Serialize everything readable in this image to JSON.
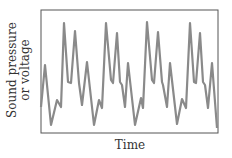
{
  "chart_data": {
    "type": "line",
    "title": "",
    "xlabel": "Time",
    "ylabel_lines": [
      "Sound pressure",
      "or voltage"
    ],
    "ylabel": "Sound pressure or voltage",
    "grid": false,
    "legend": null,
    "ticks": {
      "x": [],
      "y": []
    },
    "colors": {
      "line": "#8a8a8a",
      "frame": "#555555"
    },
    "points_px": [
      [
        41,
        107
      ],
      [
        45,
        65
      ],
      [
        51,
        125
      ],
      [
        57,
        100
      ],
      [
        61,
        107
      ],
      [
        64,
        23
      ],
      [
        68,
        82
      ],
      [
        71,
        83
      ],
      [
        75,
        31
      ],
      [
        79,
        83
      ],
      [
        82,
        105
      ],
      [
        87,
        62
      ],
      [
        94,
        125
      ],
      [
        99,
        100
      ],
      [
        102,
        108
      ],
      [
        106,
        23
      ],
      [
        111,
        80
      ],
      [
        113,
        83
      ],
      [
        117,
        33
      ],
      [
        120,
        82
      ],
      [
        122,
        85
      ],
      [
        125,
        107
      ],
      [
        128,
        63
      ],
      [
        135,
        125
      ],
      [
        141,
        98
      ],
      [
        143,
        108
      ],
      [
        147,
        22
      ],
      [
        152,
        80
      ],
      [
        154,
        83
      ],
      [
        158,
        32
      ],
      [
        162,
        82
      ],
      [
        163,
        85
      ],
      [
        167,
        107
      ],
      [
        170,
        63
      ],
      [
        177,
        124
      ],
      [
        182,
        99
      ],
      [
        186,
        108
      ],
      [
        190,
        23
      ],
      [
        194,
        82
      ],
      [
        196,
        83
      ],
      [
        200,
        33
      ],
      [
        203,
        82
      ],
      [
        205,
        85
      ],
      [
        208,
        108
      ],
      [
        212,
        63
      ],
      [
        217,
        128
      ]
    ],
    "frame_px": {
      "x": 41,
      "y": 10,
      "width": 177,
      "height": 123
    }
  }
}
